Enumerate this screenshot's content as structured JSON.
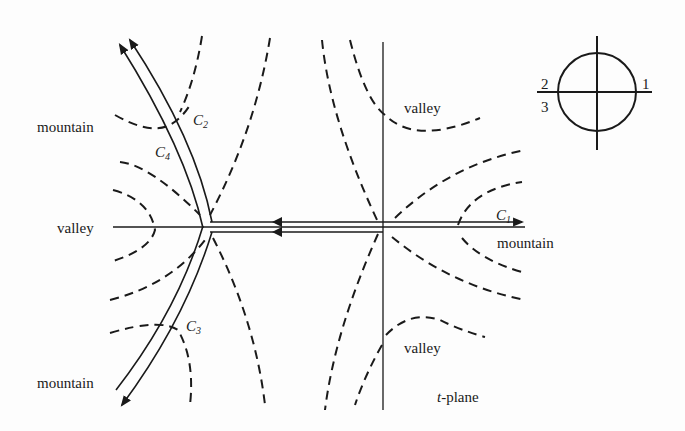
{
  "diagram": {
    "plane_label": "t-plane",
    "plane_label_var": "t",
    "plane_label_rest": "-plane",
    "region_labels": {
      "mountain_upper_left": "mountain",
      "mountain_lower_left": "mountain",
      "mountain_right": "mountain",
      "valley_left": "valley",
      "valley_upper_right": "valley",
      "valley_lower_right": "valley"
    },
    "contours": [
      {
        "name": "C",
        "sub": "1"
      },
      {
        "name": "C",
        "sub": "2"
      },
      {
        "name": "C",
        "sub": "3"
      },
      {
        "name": "C",
        "sub": "4"
      }
    ],
    "inset": {
      "labels": [
        "1",
        "2",
        "3"
      ]
    }
  }
}
